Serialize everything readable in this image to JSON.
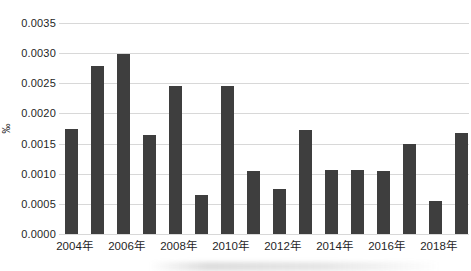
{
  "figure": {
    "background_color": "#ffffff",
    "bar_color": "#3e3e3e",
    "gridline_color": "#d8d8d8",
    "text_color": "#1f1f1f"
  },
  "chart_data": {
    "type": "bar",
    "title": "",
    "xlabel": "",
    "ylabel": "‰",
    "ylim": [
      0,
      0.0035
    ],
    "ytick_step": 0.0005,
    "ytick_labels": [
      "0.0000",
      "0.0005",
      "0.0010",
      "0.0015",
      "0.0020",
      "0.0025",
      "0.0030",
      "0.0035"
    ],
    "grid": true,
    "legend": null,
    "categories": [
      "2004年",
      "2005年",
      "2006年",
      "2007年",
      "2008年",
      "2009年",
      "2010年",
      "2011年",
      "2012年",
      "2013年",
      "2014年",
      "2015年",
      "2016年",
      "2017年",
      "2018年",
      "2019年"
    ],
    "values": [
      0.00175,
      0.00278,
      0.00298,
      0.00165,
      0.00245,
      0.00065,
      0.00245,
      0.00105,
      0.00075,
      0.00173,
      0.00106,
      0.00106,
      0.00105,
      0.0015,
      0.00055,
      0.00168
    ],
    "xtick_every": 2,
    "xtick_labels": [
      "2004年",
      "2006年",
      "2008年",
      "2010年",
      "2012年",
      "2014年",
      "2016年",
      "2018年"
    ]
  }
}
